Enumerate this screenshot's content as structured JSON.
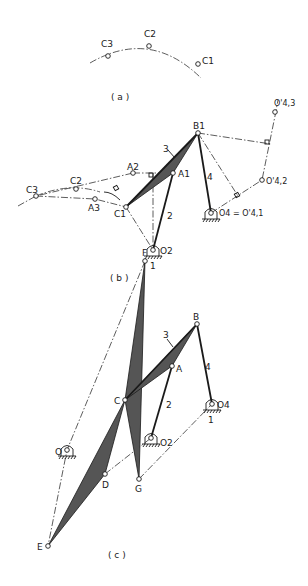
{
  "figure": {
    "panels": [
      {
        "id": "a",
        "caption": "( a )",
        "points": {
          "C3": "C3",
          "C2": "C2",
          "C1": "C1"
        }
      },
      {
        "id": "b",
        "caption": "( b )",
        "points": {
          "B1": "B1",
          "A1": "A1",
          "A2": "A2",
          "A3": "A3",
          "C1": "C1",
          "C2": "C2",
          "C3": "C3",
          "O2": "O2",
          "O4_eq": "O4 = O'4,1",
          "O4_2": "O'4,2",
          "O4_3": "O'4,3"
        },
        "links": {
          "l1": "1",
          "l2": "2",
          "l3": "3",
          "l4": "4"
        }
      },
      {
        "id": "c",
        "caption": "( c )",
        "points": {
          "F": "F",
          "B": "B",
          "A": "A",
          "C": "C",
          "O": "O",
          "O2": "O2",
          "O4": "O4",
          "D": "D",
          "G": "G",
          "E": "E"
        },
        "links": {
          "l1": "1",
          "l2": "2",
          "l3": "3",
          "l4": "4"
        }
      }
    ]
  }
}
